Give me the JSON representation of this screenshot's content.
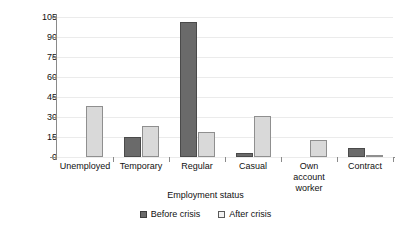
{
  "chart_data": {
    "type": "bar",
    "title": "",
    "xlabel": "Employment status",
    "ylabel": "Number of workers",
    "categories": [
      "Unemployed",
      "Temporary",
      "Regular",
      "Casual",
      "Own\naccount\nworker",
      "Contract"
    ],
    "ylim": [
      0,
      105
    ],
    "yticks": [
      0,
      15,
      30,
      45,
      60,
      75,
      90,
      105
    ],
    "grid": true,
    "legend_position": "bottom",
    "series": [
      {
        "name": "Before crisis",
        "color": "#6a6a6a",
        "values": [
          0,
          15,
          101,
          3,
          0,
          7
        ]
      },
      {
        "name": "After crisis",
        "color": "#d9d9d9",
        "values": [
          38,
          23,
          19,
          31,
          13,
          1.5
        ]
      }
    ]
  },
  "legend": {
    "items": [
      {
        "label": "Before crisis",
        "swatch": "dark-gray-swatch"
      },
      {
        "label": "After crisis",
        "swatch": "light-gray-swatch"
      }
    ]
  }
}
